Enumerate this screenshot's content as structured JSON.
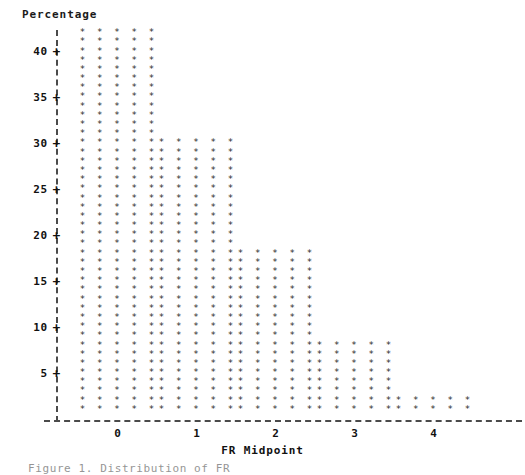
{
  "chart_data": {
    "type": "bar",
    "title": "",
    "subtitle": "",
    "ylabel": "Percentage",
    "xlabel": "FR Midpoint",
    "categories": [
      "0",
      "1",
      "2",
      "3",
      "4"
    ],
    "values": [
      42,
      30,
      18,
      8,
      2
    ],
    "ylim": [
      0,
      42
    ],
    "yticks": [
      5,
      10,
      15,
      20,
      25,
      30,
      35,
      40
    ],
    "ytick_labels": [
      "5",
      "10",
      "15",
      "20",
      "25",
      "30",
      "35",
      "40"
    ],
    "grid": false,
    "legend": null,
    "marker": "*",
    "bar_glyph_width": 5,
    "style": "ascii-character-plot"
  },
  "axes": {
    "y_title": "Percentage",
    "x_title": "FR Midpoint",
    "tick_glyph": "+",
    "y_axis_glyph": "|",
    "x_axis_glyph": "-"
  },
  "caption": {
    "text": "Figure 1. Distribution of FR"
  }
}
